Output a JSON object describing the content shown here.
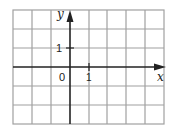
{
  "diagram": {
    "type": "coordinate-grid",
    "axes": {
      "x_label": "x",
      "y_label": "y",
      "origin_label": "0",
      "x_tick_label": "1",
      "y_tick_label": "1"
    },
    "grid": {
      "columns": 8,
      "rows": 6,
      "x_range": [
        -3,
        5
      ],
      "y_range": [
        -3,
        3
      ]
    },
    "colors": {
      "grid": "#999999",
      "axis": "#222222",
      "background": "#ffffff"
    }
  }
}
